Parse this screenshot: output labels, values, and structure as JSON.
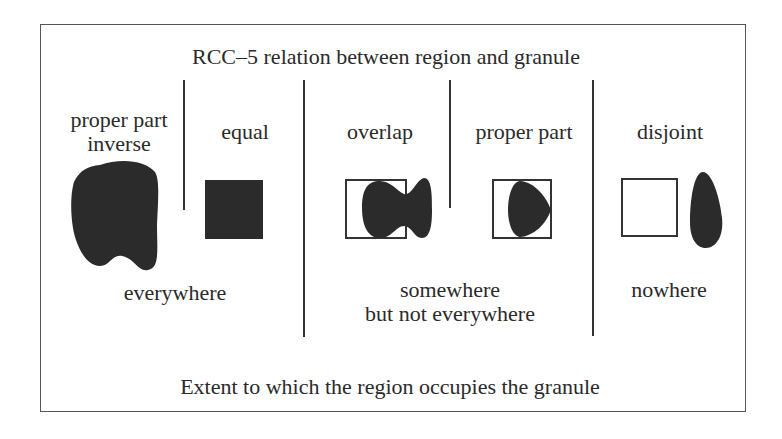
{
  "title": "RCC–5 relation between region and granule",
  "relations": [
    {
      "label_line1": "proper part",
      "label_line2": "inverse",
      "shape": "blob-covering-granule"
    },
    {
      "label_line1": "equal",
      "shape": "filled-square"
    },
    {
      "label_line1": "overlap",
      "shape": "blob-partially-in-square"
    },
    {
      "label_line1": "proper part",
      "shape": "blob-inside-square"
    },
    {
      "label_line1": "disjoint",
      "shape": "square-and-separate-blob"
    }
  ],
  "extents": [
    {
      "line1": "everywhere"
    },
    {
      "line1": "somewhere",
      "line2": "but not everywhere"
    },
    {
      "line1": "nowhere"
    }
  ],
  "footer": "Extent to which the region occupies the granule",
  "colors": {
    "fill": "#2b2b2b",
    "line": "#333333",
    "frame": "#555555"
  }
}
